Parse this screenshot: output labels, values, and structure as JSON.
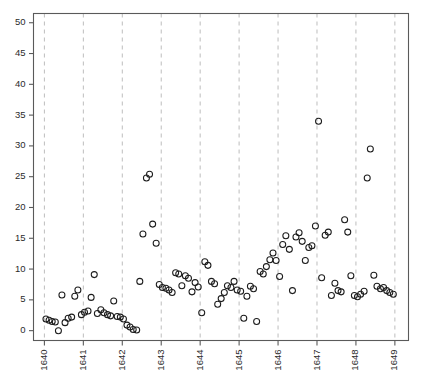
{
  "chart_data": {
    "type": "scatter",
    "title": "",
    "subtitle": "",
    "xlabel": "",
    "ylabel": "",
    "xlim": [
      1639.72,
      1649.35
    ],
    "ylim": [
      -1.6,
      51.5
    ],
    "grid": "vertical-dashed-at-x-ticks",
    "legend": "none",
    "marker": "open-circle",
    "marker_color": "#1c1c1c",
    "marker_fill": "none",
    "marker_size_px": 3.0,
    "x_tick_labels": [
      "1640",
      "1641",
      "1642",
      "1643",
      "1644",
      "1645",
      "1646",
      "1647",
      "1648",
      "1649"
    ],
    "x_tick_values": [
      1640,
      1641,
      1642,
      1643,
      1644,
      1645,
      1646,
      1647,
      1648,
      1649
    ],
    "x_tick_label_rotation_deg": 90,
    "y_tick_labels": [
      "0",
      "5",
      "10",
      "15",
      "20",
      "25",
      "30",
      "35",
      "40",
      "45",
      "50"
    ],
    "y_tick_values": [
      0,
      5,
      10,
      15,
      20,
      25,
      30,
      35,
      40,
      45,
      50
    ],
    "series": [
      {
        "name": "series-1",
        "x": [
          1640.04,
          1640.12,
          1640.2,
          1640.28,
          1640.36,
          1640.45,
          1640.53,
          1640.61,
          1640.7,
          1640.78,
          1640.86,
          1640.95,
          1641.03,
          1641.12,
          1641.2,
          1641.28,
          1641.36,
          1641.45,
          1641.53,
          1641.62,
          1641.7,
          1641.78,
          1641.87,
          1641.95,
          1642.03,
          1642.12,
          1642.2,
          1642.28,
          1642.37,
          1642.45,
          1642.53,
          1642.62,
          1642.7,
          1642.78,
          1642.87,
          1642.95,
          1643.03,
          1643.12,
          1643.2,
          1643.28,
          1643.37,
          1643.45,
          1643.53,
          1643.62,
          1643.7,
          1643.79,
          1643.87,
          1643.95,
          1644.04,
          1644.12,
          1644.2,
          1644.29,
          1644.37,
          1644.45,
          1644.54,
          1644.62,
          1644.7,
          1644.79,
          1644.87,
          1644.95,
          1645.04,
          1645.12,
          1645.2,
          1645.29,
          1645.37,
          1645.45,
          1645.54,
          1645.62,
          1645.7,
          1645.79,
          1645.87,
          1645.95,
          1646.04,
          1646.12,
          1646.2,
          1646.29,
          1646.37,
          1646.46,
          1646.54,
          1646.62,
          1646.7,
          1646.79,
          1646.87,
          1646.96,
          1647.04,
          1647.12,
          1647.21,
          1647.29,
          1647.37,
          1647.46,
          1647.54,
          1647.62,
          1647.71,
          1647.79,
          1647.87,
          1647.96,
          1648.04,
          1648.12,
          1648.21,
          1648.29,
          1648.37,
          1648.46,
          1648.54,
          1648.63,
          1648.71,
          1648.79,
          1648.87,
          1648.96
        ],
        "y": [
          1.9,
          1.7,
          1.5,
          1.4,
          0.0,
          5.8,
          1.3,
          2.0,
          2.2,
          5.6,
          6.6,
          2.6,
          3.0,
          3.2,
          5.4,
          9.1,
          2.8,
          3.4,
          2.9,
          2.6,
          2.4,
          4.8,
          2.3,
          2.2,
          1.9,
          0.9,
          0.6,
          0.2,
          0.1,
          8.0,
          15.7,
          24.8,
          25.4,
          17.3,
          14.2,
          7.5,
          7.0,
          6.9,
          6.6,
          6.2,
          9.4,
          9.2,
          7.3,
          8.9,
          8.5,
          6.3,
          7.8,
          7.1,
          2.9,
          11.2,
          10.6,
          8.0,
          7.6,
          4.3,
          5.2,
          6.2,
          7.3,
          7.0,
          8.0,
          6.6,
          6.4,
          2.0,
          5.6,
          7.2,
          6.8,
          1.5,
          9.6,
          9.2,
          10.4,
          11.5,
          12.6,
          11.4,
          8.8,
          14.0,
          15.4,
          13.2,
          6.5,
          15.2,
          15.9,
          14.5,
          11.4,
          13.5,
          13.8,
          17.0,
          34.0,
          8.6,
          15.5,
          16.0,
          5.7,
          7.7,
          6.5,
          6.3,
          18.0,
          16.0,
          8.9,
          5.7,
          5.5,
          5.9,
          6.4,
          24.8,
          29.5,
          9.0,
          7.2,
          6.8,
          7.0,
          6.5,
          6.2,
          5.9
        ]
      }
    ]
  }
}
